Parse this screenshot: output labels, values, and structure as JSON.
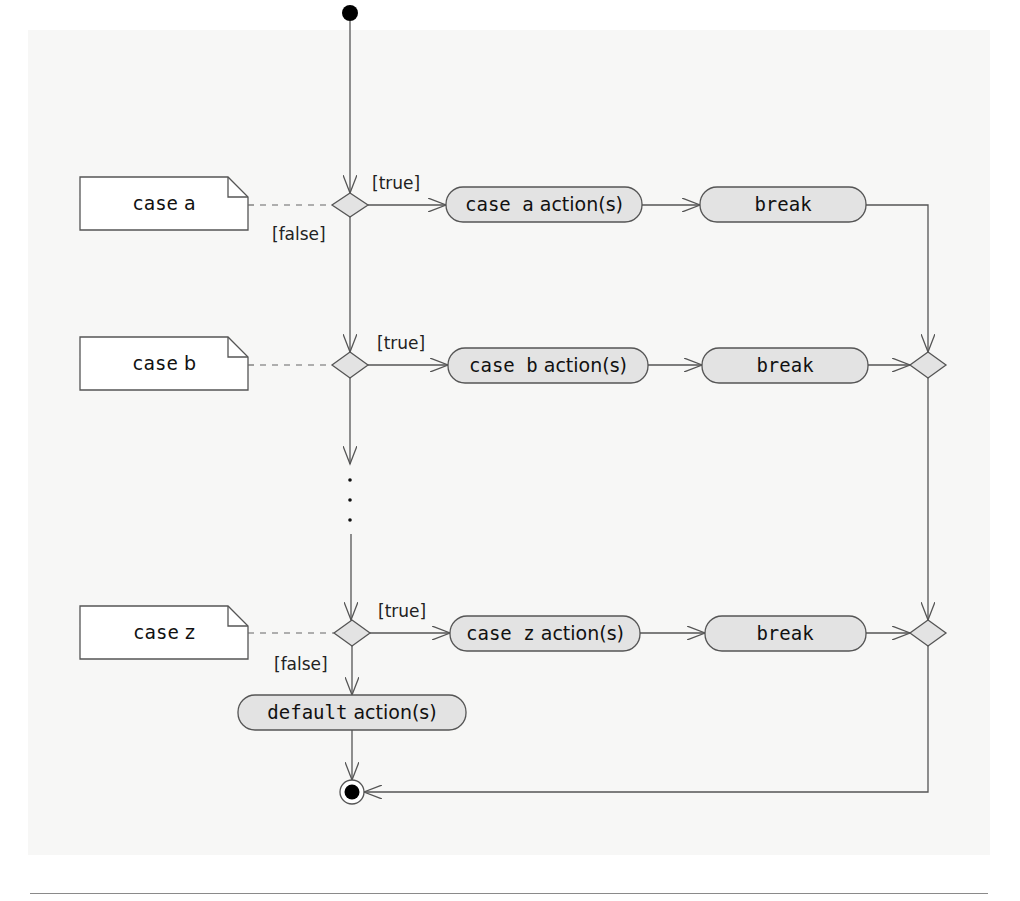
{
  "diagram": {
    "type": "UML activity diagram",
    "colors": {
      "line": "#555555",
      "action_fill": "#e3e3e3",
      "decision_fill": "#e3e3e3",
      "note_fill": "#ffffff",
      "node_black": "#000000"
    },
    "notes": [
      {
        "id": "note-a",
        "prefix": "case",
        "value": "a"
      },
      {
        "id": "note-b",
        "prefix": "case",
        "value": "b"
      },
      {
        "id": "note-z",
        "prefix": "case",
        "value": "z"
      }
    ],
    "actions": [
      {
        "id": "case-a-action",
        "keyword": "case a",
        "text": "action(s)"
      },
      {
        "id": "case-a-break",
        "keyword": "break",
        "text": ""
      },
      {
        "id": "case-b-action",
        "keyword": "case b",
        "text": "action(s)"
      },
      {
        "id": "case-b-break",
        "keyword": "break",
        "text": ""
      },
      {
        "id": "case-z-action",
        "keyword": "case z",
        "text": "action(s)"
      },
      {
        "id": "case-z-break",
        "keyword": "break",
        "text": ""
      },
      {
        "id": "default-action",
        "keyword": "default",
        "text": "action(s)"
      }
    ],
    "guards": {
      "a_true": "[true]",
      "a_false": "[false]",
      "b_true": "[true]",
      "z_true": "[true]",
      "z_false": "[false]"
    },
    "ellipsis": "⋮"
  }
}
